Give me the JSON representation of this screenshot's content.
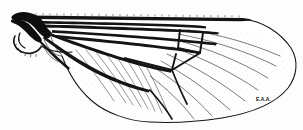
{
  "figure": {
    "orientation": "base at left, apex at right",
    "background_color": "#fdfdfd",
    "ink_color": "#111111",
    "signature": "E.A.A.",
    "width_px": 303,
    "height_px": 130
  },
  "structures": {
    "wing_outline": "wing-outline",
    "costal_margin": "costal-margin",
    "alula": "alula",
    "calypter": "calypter",
    "wing_base": "wing-base",
    "discal_cell": "discal-cell",
    "apical_field": "apical-field",
    "posterior_field": "posterior-field"
  },
  "veins": {
    "thick": [
      "costa",
      "subcosta",
      "radius-1",
      "radius-2-3",
      "radius-4-5",
      "media-1-2",
      "cubitus",
      "anal-vein"
    ],
    "crossveins": [
      "radio-medial-crossvein",
      "medial-crossvein",
      "discal-medial-crossvein"
    ],
    "thin": [
      "media-3",
      "media-4",
      "cubitus-a1",
      "apical-branch-1",
      "apical-branch-2",
      "apical-branch-3",
      "apical-branch-4",
      "apical-branch-5",
      "apical-branch-6",
      "apical-branch-7",
      "apical-branch-8"
    ]
  },
  "texture": {
    "microtrichia": "stippled-dotted-rows",
    "costal_setae": "fine-serration-along-leading-edge"
  }
}
